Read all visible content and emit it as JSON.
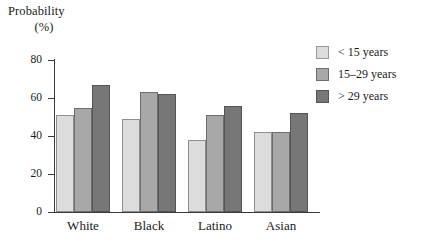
{
  "chart_data": {
    "type": "bar",
    "title": "Probability (%)",
    "ylabel_line1": "Probability",
    "ylabel_line2": "(%)",
    "xlabel": "",
    "categories": [
      "White",
      "Black",
      "Latino",
      "Asian"
    ],
    "series": [
      {
        "name": "< 15 years",
        "color": "#dcdcdc",
        "values": [
          51,
          49,
          38,
          42
        ]
      },
      {
        "name": "15–29 years",
        "color": "#a8a8a8",
        "values": [
          55,
          63,
          51,
          42
        ]
      },
      {
        "name": "> 29 years",
        "color": "#777777",
        "values": [
          67,
          62,
          56,
          52
        ]
      }
    ],
    "yticks": [
      0,
      20,
      40,
      60,
      80
    ],
    "ytick_labels": [
      "0",
      "20",
      "40",
      "60",
      "80"
    ],
    "ylim": [
      0,
      80
    ],
    "grid": false,
    "legend_position": "right"
  },
  "legend": {
    "items": [
      {
        "label": "< 15 years"
      },
      {
        "label": "15–29 years"
      },
      {
        "label": "> 29 years"
      }
    ]
  },
  "axis": {
    "ylabel_line1": "Probability",
    "ylabel_line2": "(%)"
  }
}
